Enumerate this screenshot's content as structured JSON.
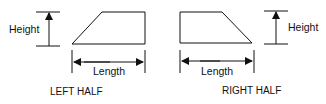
{
  "diagram": {
    "left": {
      "caption": "LEFT HALF",
      "height_label": "Height",
      "length_label": "Length"
    },
    "right": {
      "caption": "RIGHT HALF",
      "height_label": "Height",
      "length_label": "Length"
    },
    "colors": {
      "stroke": "#111111",
      "background": "#ffffff"
    }
  }
}
